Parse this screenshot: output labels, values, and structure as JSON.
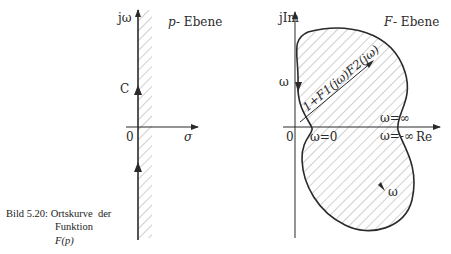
{
  "p_plane": {
    "title": "p-Ebene",
    "title_var": "p",
    "title_suffix": "- Ebene",
    "y_axis_label": "jω",
    "x_axis_label": "σ",
    "origin_label": "0",
    "contour_label": "C"
  },
  "f_plane": {
    "title_var": "F",
    "title_suffix": "- Ebene",
    "y_axis_label": "jIm",
    "x_axis_label": "Re",
    "origin_label": "0",
    "vector_label": "1+F1(jω)F2(jω)",
    "omega_label_top": "ω",
    "omega_label_bottom": "ω",
    "omega_zero": "ω=0",
    "omega_inf": "ω=∞",
    "omega_neg_inf": "ω=-∞"
  },
  "caption": {
    "label": "Bild 5.20:",
    "line1": "Ortskurve  der",
    "line2": "Funktion",
    "line3": "F(p)"
  },
  "colors": {
    "ink": "#2a2a2a",
    "hatch": "#8a8a8a"
  }
}
